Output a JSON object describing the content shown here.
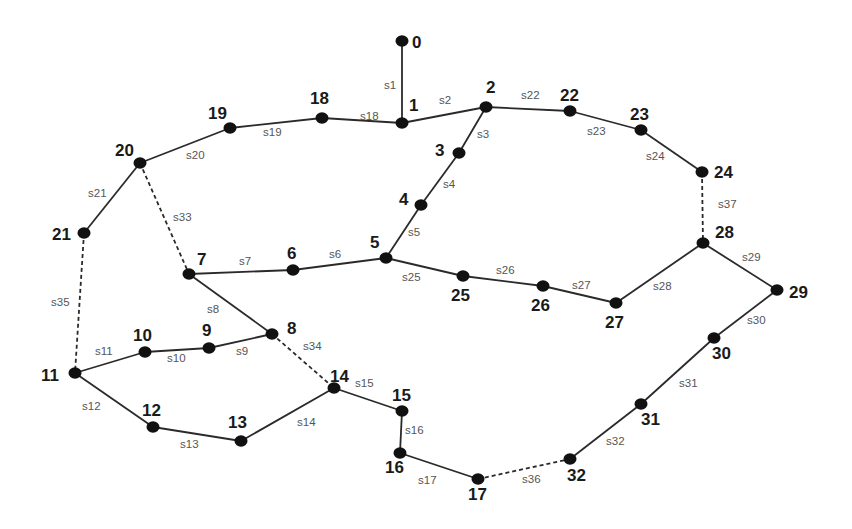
{
  "diagram": {
    "type": "network-graph",
    "nodes": [
      {
        "id": "0",
        "x": 402,
        "y": 41,
        "lx": 412,
        "ly": 48
      },
      {
        "id": "1",
        "x": 402,
        "y": 123,
        "lx": 409,
        "ly": 111
      },
      {
        "id": "2",
        "x": 486,
        "y": 107,
        "lx": 486,
        "ly": 93
      },
      {
        "id": "3",
        "x": 459,
        "y": 153,
        "lx": 435,
        "ly": 156
      },
      {
        "id": "4",
        "x": 421,
        "y": 205,
        "lx": 399,
        "ly": 205
      },
      {
        "id": "5",
        "x": 386,
        "y": 258,
        "lx": 370,
        "ly": 248
      },
      {
        "id": "6",
        "x": 293,
        "y": 270,
        "lx": 287,
        "ly": 259
      },
      {
        "id": "7",
        "x": 189,
        "y": 274,
        "lx": 197,
        "ly": 265
      },
      {
        "id": "8",
        "x": 272,
        "y": 334,
        "lx": 287,
        "ly": 334
      },
      {
        "id": "9",
        "x": 209,
        "y": 348,
        "lx": 202,
        "ly": 336
      },
      {
        "id": "10",
        "x": 145,
        "y": 352,
        "lx": 133,
        "ly": 341
      },
      {
        "id": "11",
        "x": 75,
        "y": 373,
        "lx": 41,
        "ly": 381
      },
      {
        "id": "12",
        "x": 153,
        "y": 427,
        "lx": 142,
        "ly": 416
      },
      {
        "id": "13",
        "x": 241,
        "y": 441,
        "lx": 228,
        "ly": 428
      },
      {
        "id": "14",
        "x": 334,
        "y": 388,
        "lx": 330,
        "ly": 382
      },
      {
        "id": "15",
        "x": 402,
        "y": 411,
        "lx": 392,
        "ly": 401
      },
      {
        "id": "16",
        "x": 400,
        "y": 453,
        "lx": 385,
        "ly": 473
      },
      {
        "id": "17",
        "x": 478,
        "y": 479,
        "lx": 468,
        "ly": 500
      },
      {
        "id": "18",
        "x": 322,
        "y": 118,
        "lx": 310,
        "ly": 104
      },
      {
        "id": "19",
        "x": 230,
        "y": 128,
        "lx": 208,
        "ly": 119
      },
      {
        "id": "20",
        "x": 140,
        "y": 163,
        "lx": 115,
        "ly": 156
      },
      {
        "id": "21",
        "x": 84,
        "y": 233,
        "lx": 52,
        "ly": 240
      },
      {
        "id": "22",
        "x": 570,
        "y": 111,
        "lx": 560,
        "ly": 101
      },
      {
        "id": "23",
        "x": 641,
        "y": 130,
        "lx": 630,
        "ly": 120
      },
      {
        "id": "24",
        "x": 702,
        "y": 172,
        "lx": 714,
        "ly": 178
      },
      {
        "id": "25",
        "x": 463,
        "y": 276,
        "lx": 451,
        "ly": 301
      },
      {
        "id": "26",
        "x": 543,
        "y": 286,
        "lx": 531,
        "ly": 311
      },
      {
        "id": "27",
        "x": 616,
        "y": 303,
        "lx": 605,
        "ly": 328
      },
      {
        "id": "28",
        "x": 703,
        "y": 243,
        "lx": 715,
        "ly": 238
      },
      {
        "id": "29",
        "x": 777,
        "y": 290,
        "lx": 789,
        "ly": 298
      },
      {
        "id": "30",
        "x": 714,
        "y": 338,
        "lx": 712,
        "ly": 359
      },
      {
        "id": "31",
        "x": 641,
        "y": 404,
        "lx": 641,
        "ly": 425
      },
      {
        "id": "32",
        "x": 570,
        "y": 459,
        "lx": 567,
        "ly": 481
      }
    ],
    "edges": [
      {
        "id": "s1",
        "from": "0",
        "to": "1",
        "style": "solid",
        "lx": 384,
        "ly": 89
      },
      {
        "id": "s2",
        "from": "1",
        "to": "2",
        "style": "solid",
        "lx": 439,
        "ly": 104
      },
      {
        "id": "s3",
        "from": "2",
        "to": "3",
        "style": "solid",
        "lx": 477,
        "ly": 138
      },
      {
        "id": "s4",
        "from": "3",
        "to": "4",
        "style": "solid",
        "lx": 443,
        "ly": 188
      },
      {
        "id": "s5",
        "from": "4",
        "to": "5",
        "style": "solid",
        "lx": 408,
        "ly": 236
      },
      {
        "id": "s6",
        "from": "5",
        "to": "6",
        "style": "solid",
        "lx": 329,
        "ly": 258
      },
      {
        "id": "s7",
        "from": "6",
        "to": "7",
        "style": "solid",
        "lx": 239,
        "ly": 265
      },
      {
        "id": "s8",
        "from": "7",
        "to": "8",
        "style": "solid",
        "lx": 207,
        "ly": 313
      },
      {
        "id": "s9",
        "from": "8",
        "to": "9",
        "style": "solid",
        "lx": 236,
        "ly": 355
      },
      {
        "id": "s10",
        "from": "9",
        "to": "10",
        "style": "solid",
        "lx": 167,
        "ly": 362
      },
      {
        "id": "s11",
        "from": "10",
        "to": "11",
        "style": "solid",
        "lx": 95,
        "ly": 355
      },
      {
        "id": "s12",
        "from": "11",
        "to": "12",
        "style": "solid",
        "lx": 82,
        "ly": 410
      },
      {
        "id": "s13",
        "from": "12",
        "to": "13",
        "style": "solid",
        "lx": 180,
        "ly": 448
      },
      {
        "id": "s14",
        "from": "13",
        "to": "14",
        "style": "solid",
        "lx": 297,
        "ly": 426
      },
      {
        "id": "s15",
        "from": "14",
        "to": "15",
        "style": "solid",
        "lx": 355,
        "ly": 387
      },
      {
        "id": "s16",
        "from": "15",
        "to": "16",
        "style": "solid",
        "lx": 405,
        "ly": 434
      },
      {
        "id": "s17",
        "from": "16",
        "to": "17",
        "style": "solid",
        "lx": 418,
        "ly": 484
      },
      {
        "id": "s18",
        "from": "1",
        "to": "18",
        "style": "solid",
        "lx": 360,
        "ly": 120
      },
      {
        "id": "s19",
        "from": "18",
        "to": "19",
        "style": "solid",
        "lx": 263,
        "ly": 136
      },
      {
        "id": "s20",
        "from": "19",
        "to": "20",
        "style": "solid",
        "lx": 186,
        "ly": 159
      },
      {
        "id": "s21",
        "from": "20",
        "to": "21",
        "style": "solid",
        "lx": 88,
        "ly": 197
      },
      {
        "id": "s22",
        "from": "2",
        "to": "22",
        "style": "solid",
        "lx": 521,
        "ly": 99
      },
      {
        "id": "s23",
        "from": "22",
        "to": "23",
        "style": "solid",
        "lx": 587,
        "ly": 135
      },
      {
        "id": "s24",
        "from": "23",
        "to": "24",
        "style": "solid",
        "lx": 646,
        "ly": 160
      },
      {
        "id": "s25",
        "from": "5",
        "to": "25",
        "style": "solid",
        "lx": 402,
        "ly": 281
      },
      {
        "id": "s26",
        "from": "25",
        "to": "26",
        "style": "solid",
        "lx": 496,
        "ly": 274
      },
      {
        "id": "s27",
        "from": "26",
        "to": "27",
        "style": "solid",
        "lx": 572,
        "ly": 289
      },
      {
        "id": "s28",
        "from": "27",
        "to": "28",
        "style": "solid",
        "lx": 653,
        "ly": 290
      },
      {
        "id": "s29",
        "from": "28",
        "to": "29",
        "style": "solid",
        "lx": 742,
        "ly": 261
      },
      {
        "id": "s30",
        "from": "29",
        "to": "30",
        "style": "solid",
        "lx": 747,
        "ly": 324
      },
      {
        "id": "s31",
        "from": "30",
        "to": "31",
        "style": "solid",
        "lx": 679,
        "ly": 387
      },
      {
        "id": "s32",
        "from": "31",
        "to": "32",
        "style": "solid",
        "lx": 606,
        "ly": 445
      },
      {
        "id": "s33",
        "from": "20",
        "to": "7",
        "style": "dashed",
        "lx": 173,
        "ly": 221
      },
      {
        "id": "s34",
        "from": "8",
        "to": "14",
        "style": "dashed",
        "lx": 303,
        "ly": 350
      },
      {
        "id": "s35",
        "from": "21",
        "to": "11",
        "style": "dashed",
        "lx": 51,
        "ly": 306
      },
      {
        "id": "s36",
        "from": "17",
        "to": "32",
        "style": "dashed",
        "lx": 522,
        "ly": 483
      },
      {
        "id": "s37",
        "from": "24",
        "to": "28",
        "style": "dashed",
        "lx": 718,
        "ly": 208
      }
    ]
  }
}
